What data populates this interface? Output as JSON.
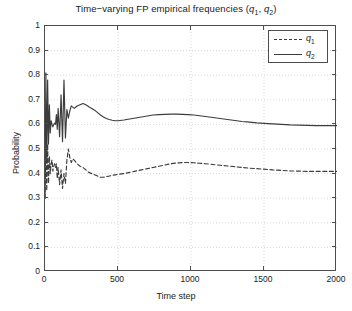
{
  "chart_data": {
    "type": "line",
    "title": "Time−varying FP empirical frequencies (q1, q2)",
    "title_main": "Time−varying FP empirical frequencies (",
    "title_q1": "q",
    "title_q1_sub": "1",
    "title_comma": ", ",
    "title_q2": "q",
    "title_q2_sub": "2",
    "title_close": ")",
    "xlabel": "Time step",
    "ylabel": "Probability",
    "xlim": [
      0,
      2000
    ],
    "ylim": [
      0,
      1
    ],
    "xticks": [
      0,
      500,
      1000,
      1500,
      2000
    ],
    "xtick_labels": [
      "0",
      "500",
      "1000",
      "1500",
      "2000"
    ],
    "yticks": [
      0,
      0.1,
      0.2,
      0.3,
      0.4,
      0.5,
      0.6,
      0.7,
      0.8,
      0.9,
      1
    ],
    "ytick_labels": [
      "0",
      "0.1",
      "0.2",
      "0.3",
      "0.4",
      "0.5",
      "0.6",
      "0.7",
      "0.8",
      "0.9",
      "1"
    ],
    "grid": true,
    "grid_style": "dotted",
    "grid_color": "#d9d9d9",
    "legend_position": "top-right-inside",
    "legend_entries": [
      {
        "name": "q1",
        "label_base": "q",
        "label_sub": "1",
        "style": "dashed",
        "color": "#3c3c3c"
      },
      {
        "name": "q2",
        "label_base": "q",
        "label_sub": "2",
        "style": "solid",
        "color": "#3c3c3c"
      }
    ],
    "series": [
      {
        "name": "q1",
        "style": "dashed",
        "color": "#3c3c3c",
        "x": [
          0,
          6,
          12,
          18,
          24,
          30,
          36,
          42,
          48,
          54,
          60,
          66,
          72,
          78,
          84,
          90,
          100,
          110,
          120,
          130,
          140,
          150,
          160,
          170,
          180,
          190,
          200,
          220,
          240,
          260,
          280,
          300,
          320,
          340,
          360,
          380,
          400,
          420,
          440,
          460,
          480,
          500,
          540,
          580,
          620,
          660,
          700,
          740,
          780,
          820,
          860,
          900,
          940,
          980,
          1020,
          1060,
          1100,
          1150,
          1200,
          1250,
          1300,
          1350,
          1400,
          1450,
          1500,
          1560,
          1620,
          1680,
          1740,
          1800,
          1860,
          1920,
          1970,
          2000
        ],
        "y": [
          0.3,
          0.5,
          0.33,
          0.52,
          0.36,
          0.47,
          0.4,
          0.44,
          0.455,
          0.41,
          0.43,
          0.44,
          0.425,
          0.44,
          0.38,
          0.425,
          0.355,
          0.415,
          0.34,
          0.4,
          0.36,
          0.455,
          0.5,
          0.465,
          0.445,
          0.46,
          0.455,
          0.44,
          0.43,
          0.425,
          0.415,
          0.405,
          0.4,
          0.395,
          0.39,
          0.385,
          0.385,
          0.388,
          0.39,
          0.393,
          0.395,
          0.397,
          0.4,
          0.405,
          0.41,
          0.415,
          0.42,
          0.425,
          0.43,
          0.435,
          0.44,
          0.443,
          0.445,
          0.445,
          0.444,
          0.442,
          0.44,
          0.437,
          0.434,
          0.431,
          0.428,
          0.425,
          0.422,
          0.42,
          0.418,
          0.415,
          0.413,
          0.411,
          0.41,
          0.409,
          0.409,
          0.409,
          0.409,
          0.409
        ]
      },
      {
        "name": "q2",
        "style": "solid",
        "color": "#3c3c3c",
        "x": [
          0,
          6,
          12,
          18,
          24,
          30,
          36,
          42,
          48,
          54,
          60,
          66,
          72,
          78,
          84,
          90,
          100,
          110,
          120,
          130,
          140,
          150,
          160,
          170,
          180,
          190,
          200,
          220,
          240,
          260,
          280,
          300,
          320,
          340,
          360,
          380,
          400,
          420,
          440,
          460,
          480,
          500,
          540,
          580,
          620,
          660,
          700,
          740,
          780,
          820,
          860,
          900,
          940,
          980,
          1020,
          1060,
          1100,
          1150,
          1200,
          1250,
          1300,
          1350,
          1400,
          1450,
          1500,
          1560,
          1620,
          1680,
          1740,
          1800,
          1860,
          1920,
          1970,
          2000
        ],
        "y": [
          0.3,
          0.81,
          0.45,
          0.78,
          0.52,
          0.68,
          0.565,
          0.615,
          0.6,
          0.59,
          0.6,
          0.605,
          0.6,
          0.64,
          0.58,
          0.665,
          0.55,
          0.72,
          0.53,
          0.78,
          0.545,
          0.66,
          0.625,
          0.655,
          0.675,
          0.67,
          0.665,
          0.675,
          0.68,
          0.685,
          0.68,
          0.672,
          0.665,
          0.658,
          0.648,
          0.638,
          0.63,
          0.624,
          0.62,
          0.617,
          0.615,
          0.615,
          0.618,
          0.622,
          0.626,
          0.63,
          0.634,
          0.638,
          0.64,
          0.641,
          0.642,
          0.642,
          0.641,
          0.64,
          0.638,
          0.635,
          0.632,
          0.628,
          0.624,
          0.62,
          0.616,
          0.612,
          0.609,
          0.606,
          0.604,
          0.602,
          0.6,
          0.598,
          0.597,
          0.596,
          0.595,
          0.595,
          0.595,
          0.595
        ]
      }
    ]
  }
}
